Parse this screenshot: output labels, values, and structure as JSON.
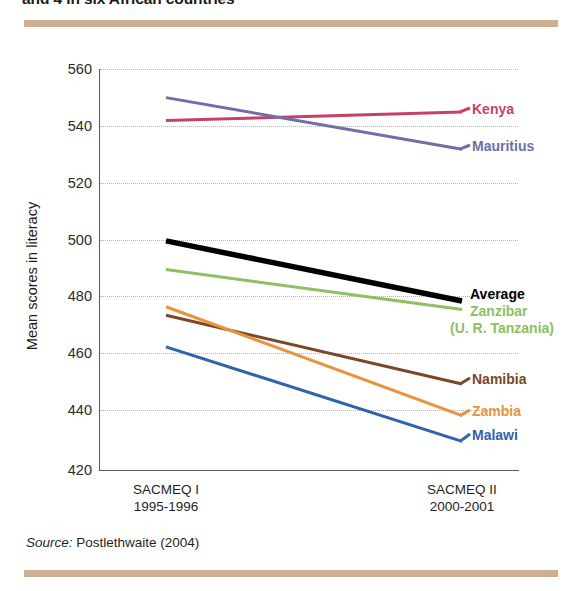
{
  "figure": {
    "title": "and 4 in six African countries",
    "source_prefix": "Source:",
    "source_text": " Postlethwaite (2004)"
  },
  "decor": {
    "rule_color": "#cbab8c"
  },
  "chart_data": {
    "type": "line",
    "xlabel": "",
    "ylabel": "Mean scores in literacy",
    "categories": [
      "SACMEQ I",
      "SACMEQ II"
    ],
    "category_sublabels": [
      "1995-1996",
      "2000-2001"
    ],
    "ylim": [
      420,
      560
    ],
    "yticks": [
      420,
      440,
      460,
      480,
      500,
      520,
      540,
      560
    ],
    "grid": "horizontal-dotted",
    "legend_position": "right-inline",
    "series": [
      {
        "name": "Kenya",
        "label": "Kenya",
        "values": [
          542,
          545
        ],
        "color": "#c94066"
      },
      {
        "name": "Mauritius",
        "label": "Mauritius",
        "values": [
          550,
          532
        ],
        "color": "#6f6fa8"
      },
      {
        "name": "Average",
        "label": "Average",
        "values": [
          500,
          479
        ],
        "color": "#000000"
      },
      {
        "name": "Zanzibar",
        "label": "Zanzibar",
        "label2": "(U. R. Tanzania)",
        "values": [
          490,
          476
        ],
        "color": "#8dc060"
      },
      {
        "name": "Namibia",
        "label": "Namibia",
        "values": [
          474,
          450
        ],
        "color": "#7b4726"
      },
      {
        "name": "Zambia",
        "label": "Zambia",
        "values": [
          477,
          439
        ],
        "color": "#e8933f"
      },
      {
        "name": "Malawi",
        "label": "Malawi",
        "values": [
          463,
          430
        ],
        "color": "#2f63ad"
      }
    ]
  }
}
